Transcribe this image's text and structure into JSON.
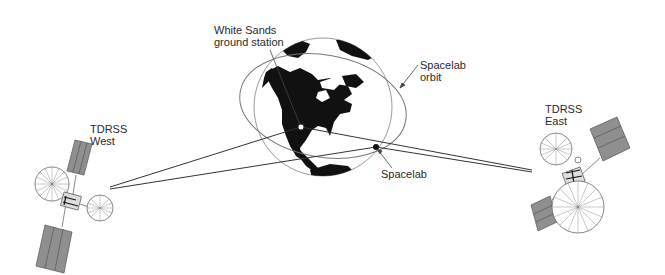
{
  "diagram": {
    "type": "satellite-communication-link",
    "labels": {
      "ground_station": {
        "line1": "White Sands",
        "line2": "ground station"
      },
      "orbit": {
        "line1": "Spacelab",
        "line2": "orbit"
      },
      "spacelab": {
        "text": "Spacelab"
      },
      "tdrss_west": {
        "line1": "TDRSS",
        "line2": "West"
      },
      "tdrss_east": {
        "line1": "TDRSS",
        "line2": "East"
      }
    },
    "colors": {
      "land": "#111111",
      "outline": "#9a9a9a",
      "link": "#333333",
      "panel": "#8f8f8f",
      "text": "#2a2a2a"
    }
  }
}
